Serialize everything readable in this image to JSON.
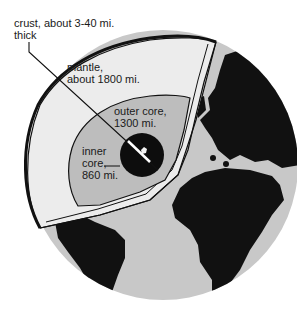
{
  "diagram": {
    "labels": {
      "crust": [
        "crust, about 3-40 mi.",
        "thick"
      ],
      "mantle": [
        "mantle,",
        "about 1800 mi."
      ],
      "outer_core": [
        "outer core,",
        "1300 mi."
      ],
      "inner_core": [
        "inner",
        "core,",
        "860 mi."
      ]
    },
    "colors": {
      "ocean": "#c8c8c8",
      "land": "#111111",
      "mantle": "#ececec",
      "outer_core": "#bdbdbd",
      "inner_core": "#0d0d0d",
      "outline": "#111111"
    }
  }
}
